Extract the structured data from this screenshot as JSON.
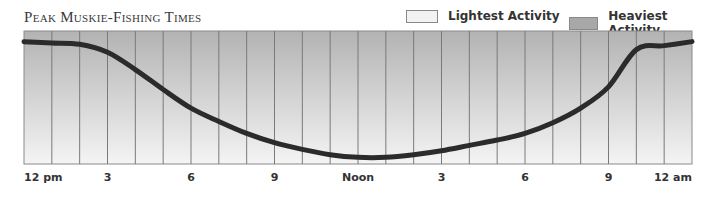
{
  "title": "Peak Muskie-Fishing Times",
  "legend": {
    "light_label": "Lightest Activity",
    "heavy_label": "Heaviest Activity",
    "light_color": "#f2f2f2",
    "heavy_color": "#a8a8a8"
  },
  "colors": {
    "curve": "#2b2b2b",
    "grid": "#7a7a7a",
    "gradient_top": "#b3b3b3",
    "gradient_bottom": "#f4f4f4"
  },
  "x_labels": [
    {
      "label": "12 pm",
      "hour": 0
    },
    {
      "label": "3",
      "hour": 3
    },
    {
      "label": "6",
      "hour": 6
    },
    {
      "label": "9",
      "hour": 9
    },
    {
      "label": "Noon",
      "hour": 12
    },
    {
      "label": "3",
      "hour": 15
    },
    {
      "label": "6",
      "hour": 18
    },
    {
      "label": "9",
      "hour": 21
    },
    {
      "label": "12 am",
      "hour": 24
    }
  ],
  "chart_data": {
    "type": "line",
    "title": "Peak Muskie-Fishing Times",
    "xlabel": "",
    "ylabel": "",
    "x": [
      0,
      1,
      2,
      3,
      4,
      5,
      6,
      7,
      8,
      9,
      10,
      11,
      12,
      13,
      14,
      15,
      16,
      17,
      18,
      19,
      20,
      21,
      22,
      23,
      24
    ],
    "tick_labels": [
      "12 pm",
      "3",
      "6",
      "9",
      "Noon",
      "3",
      "6",
      "9",
      "12 am"
    ],
    "tick_positions": [
      0,
      3,
      6,
      9,
      12,
      15,
      18,
      21,
      24
    ],
    "series": [
      {
        "name": "Fishing activity (0 = lightest, 100 = heaviest)",
        "values": [
          92,
          91,
          90,
          84,
          71,
          56,
          42,
          32,
          23,
          16,
          11,
          7,
          5,
          5,
          7,
          10,
          14,
          18,
          23,
          31,
          42,
          58,
          86,
          89,
          92
        ]
      }
    ],
    "ylim": [
      0,
      100
    ],
    "grid": "vertical lines every hour",
    "legend": [
      "Lightest Activity",
      "Heaviest Activity"
    ],
    "legend_position": "top-right",
    "background": "vertical gradient from heavy (top, dark gray) to light (bottom, near white)"
  }
}
